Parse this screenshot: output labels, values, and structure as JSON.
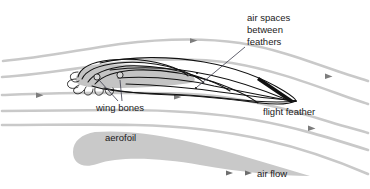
{
  "diagram": {
    "background_color": "#ffffff",
    "labels": {
      "air_spaces_line1": "air spaces",
      "air_spaces_line2": "between",
      "air_spaces_line3": "feathers",
      "wing_bones": "wing bones",
      "flight_feather": "flight feather",
      "aerofoil": "aerofoil",
      "air_flow": "air flow"
    },
    "colors": {
      "streamline": "#c9c9c9",
      "feather_outline": "#111111",
      "wing_body_fill": "#c4c4c4",
      "aerofoil_fill": "#c9c9c9",
      "leader_line": "#3a3a4a",
      "text": "#1a1a1a",
      "arrow": "#7d7d7d"
    },
    "elements": {
      "streamline_count": 5,
      "flow_direction": "left-to-right",
      "bone_count": 2
    }
  }
}
